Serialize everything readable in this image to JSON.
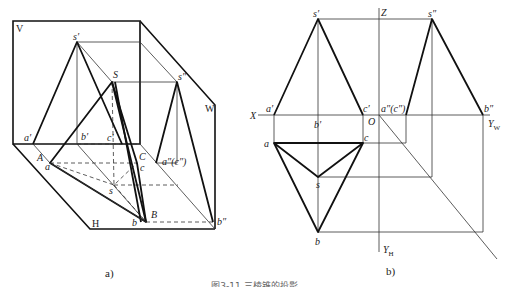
{
  "figure": {
    "caption": "图3-11  三棱锥的投影",
    "subfigures": [
      {
        "id": "a",
        "label": "a)",
        "description": "Axonometric view of triangular pyramid SABC projected onto V, H and W planes",
        "planes": {
          "V": "V",
          "H": "H",
          "W": "W"
        },
        "points": {
          "S": "S",
          "A": "A",
          "B": "B",
          "C": "C",
          "s_v": "s′",
          "a_v": "a′",
          "b_v": "b′",
          "c_v": "c′",
          "s_h": "s",
          "a_h": "a",
          "b_h": "b",
          "c_h": "c",
          "s_w": "s″",
          "ac_w": "a″(c″)",
          "b_w": "b″"
        }
      },
      {
        "id": "b",
        "label": "b)",
        "description": "Orthographic three-view projection of triangular pyramid",
        "axes": {
          "X": "X",
          "Z": "Z",
          "O": "O",
          "YW": "Y",
          "YW_sub": "W",
          "YH": "Y",
          "YH_sub": "H"
        },
        "points": {
          "s_v": "s′",
          "a_v": "a′",
          "b_v": "b′",
          "c_v": "c′",
          "s_h": "s",
          "a_h": "a",
          "b_h": "b",
          "c_h": "c",
          "s_w": "s″",
          "ac_w": "a″(c″)",
          "b_w": "b″"
        }
      }
    ]
  }
}
